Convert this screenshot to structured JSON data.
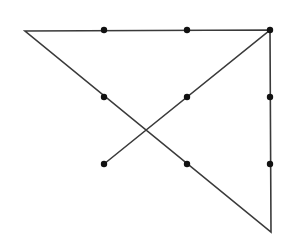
{
  "diagram": {
    "type": "nine-dot-puzzle-solution",
    "colors": {
      "background": "#ffffff",
      "line": "#3a3a3a",
      "dot": "#111111"
    },
    "grid": {
      "columns_x": [
        104,
        187,
        270
      ],
      "rows_y": [
        30,
        97,
        164
      ]
    },
    "dots": [
      {
        "id": "r1c1",
        "x": 104,
        "y": 30
      },
      {
        "id": "r1c2",
        "x": 187,
        "y": 30
      },
      {
        "id": "r1c3",
        "x": 270,
        "y": 30
      },
      {
        "id": "r2c1",
        "x": 104,
        "y": 97
      },
      {
        "id": "r2c2",
        "x": 187,
        "y": 97
      },
      {
        "id": "r2c3",
        "x": 270,
        "y": 97
      },
      {
        "id": "r3c1",
        "x": 104,
        "y": 164
      },
      {
        "id": "r3c2",
        "x": 187,
        "y": 164
      },
      {
        "id": "r3c3",
        "x": 270,
        "y": 164
      }
    ],
    "path": [
      {
        "x": 104,
        "y": 164
      },
      {
        "x": 270,
        "y": 30
      },
      {
        "x": 25,
        "y": 31
      },
      {
        "x": 271,
        "y": 232
      },
      {
        "x": 270,
        "y": 30
      }
    ]
  }
}
